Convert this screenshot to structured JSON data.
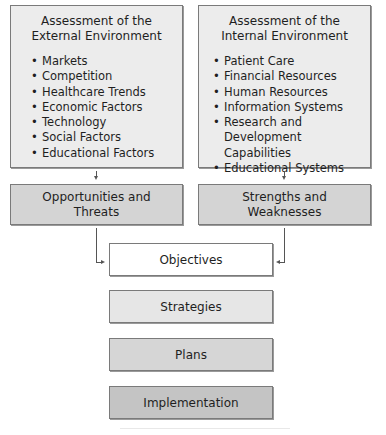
{
  "external": {
    "title_line1": "Assessment of the",
    "title_line2": "External Environment",
    "items": [
      "Markets",
      "Competition",
      "Healthcare Trends",
      "Economic Factors",
      "Technology",
      "Social Factors",
      "Educational Factors"
    ]
  },
  "internal": {
    "title_line1": "Assessment of the",
    "title_line2": "Internal Environment",
    "items": [
      "Patient Care",
      "Financial Resources",
      "Human Resources",
      "Information Systems",
      "Research and Development",
      "Capabilities",
      "Educational Systems"
    ]
  },
  "opportunities": {
    "line1": "Opportunities and",
    "line2": "Threats"
  },
  "strengths": {
    "line1": "Strengths and",
    "line2": "Weaknesses"
  },
  "flow": {
    "objectives": "Objectives",
    "strategies": "Strategies",
    "plans": "Plans",
    "implementation": "Implementation"
  },
  "colors": {
    "assessment_fill": "#ececec",
    "swot_fill": "#d4d4d4",
    "objectives_fill": "#ffffff",
    "strategies_fill": "#e6e6e6",
    "plans_fill": "#d6d6d6",
    "implementation_fill": "#c4c4c4"
  }
}
